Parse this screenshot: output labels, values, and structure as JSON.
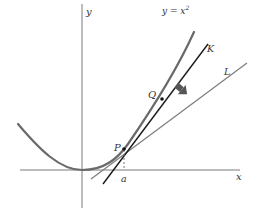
{
  "figure": {
    "axes": {
      "x_label": "x",
      "y_label": "y"
    },
    "curve": {
      "label_prefix": "y = x",
      "label_exponent": "2"
    },
    "lines": {
      "secant_label": "K",
      "tangent_label": "L"
    },
    "points": {
      "p_label": "P",
      "q_label": "Q",
      "a_label": "a"
    },
    "colors": {
      "axis": "#7a7a7a",
      "curve": "#6a6a6a",
      "secant": "#1a1a1a",
      "tangent": "#808080",
      "arrow": "#555555"
    }
  }
}
